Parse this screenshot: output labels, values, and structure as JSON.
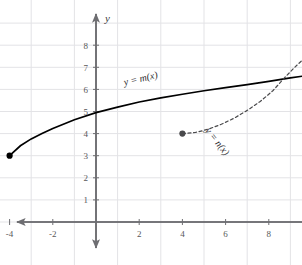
{
  "chart_data": {
    "type": "line",
    "title": "",
    "xlabel": "x",
    "ylabel": "y",
    "xlim": [
      -5.5,
      15.8
    ],
    "ylim": [
      -0.9,
      9.2
    ],
    "grid": true,
    "grid_spacing": 1,
    "legend_position": "inline-annotations",
    "xticks": [
      "-4",
      "-2",
      "2",
      "4",
      "6",
      "8",
      "10",
      "12",
      "14"
    ],
    "xtick_values": [
      -4,
      -2,
      2,
      4,
      6,
      8,
      10,
      12,
      14
    ],
    "yticks": [
      "1",
      "2",
      "3",
      "4",
      "5",
      "6",
      "7",
      "8"
    ],
    "ytick_values": [
      1,
      2,
      3,
      4,
      5,
      6,
      7,
      8
    ],
    "series": [
      {
        "name": "y = m(x)",
        "style": "solid",
        "color": "#000000",
        "start_point": {
          "x": -4,
          "y": 3,
          "marker": "closed-dot"
        },
        "end_arrow": true,
        "points": [
          {
            "x": -4,
            "y": 3.0
          },
          {
            "x": -3.5,
            "y": 3.45
          },
          {
            "x": -3,
            "y": 3.76
          },
          {
            "x": -2.5,
            "y": 4.0
          },
          {
            "x": -2,
            "y": 4.23
          },
          {
            "x": -1,
            "y": 4.63
          },
          {
            "x": 0,
            "y": 4.95
          },
          {
            "x": 1,
            "y": 5.2
          },
          {
            "x": 2,
            "y": 5.43
          },
          {
            "x": 3,
            "y": 5.62
          },
          {
            "x": 4,
            "y": 5.78
          },
          {
            "x": 5,
            "y": 5.94
          },
          {
            "x": 6,
            "y": 6.08
          },
          {
            "x": 7,
            "y": 6.22
          },
          {
            "x": 8,
            "y": 6.36
          },
          {
            "x": 9,
            "y": 6.52
          },
          {
            "x": 10,
            "y": 6.66
          },
          {
            "x": 11,
            "y": 6.8
          },
          {
            "x": 12,
            "y": 6.92
          },
          {
            "x": 13,
            "y": 7.05
          },
          {
            "x": 14,
            "y": 7.2
          },
          {
            "x": 15.3,
            "y": 7.4
          }
        ]
      },
      {
        "name": "y = n(x)",
        "style": "dashed",
        "color": "#4a4a4c",
        "start_point": {
          "x": 4,
          "y": 4,
          "marker": "closed-dot"
        },
        "end_arrow": true,
        "points": [
          {
            "x": 4,
            "y": 4.0
          },
          {
            "x": 4.6,
            "y": 4.05
          },
          {
            "x": 5.2,
            "y": 4.2
          },
          {
            "x": 5.8,
            "y": 4.42
          },
          {
            "x": 6.4,
            "y": 4.7
          },
          {
            "x": 7.0,
            "y": 5.05
          },
          {
            "x": 7.6,
            "y": 5.45
          },
          {
            "x": 8.2,
            "y": 5.95
          },
          {
            "x": 8.7,
            "y": 6.5
          },
          {
            "x": 9.2,
            "y": 7.0
          },
          {
            "x": 9.8,
            "y": 7.55
          },
          {
            "x": 10.4,
            "y": 8.0
          },
          {
            "x": 11.0,
            "y": 8.4
          },
          {
            "x": 11.5,
            "y": 8.75
          }
        ]
      }
    ],
    "annotations": [
      {
        "text": "y = m(x)",
        "x": 2.1,
        "y": 6.35,
        "rotation": -13
      },
      {
        "text": "y = n(x)",
        "x": 5.5,
        "y": 3.55,
        "rotation": 52
      }
    ],
    "intersection": {
      "x": 8.7,
      "y": 6.5
    },
    "colors": {
      "background": "#ffffff",
      "grid": "#e3e3e6",
      "axis": "#6e6e72",
      "curve_solid": "#000000",
      "curve_dashed": "#4a4a4c",
      "tick_text": "#58585a"
    }
  }
}
